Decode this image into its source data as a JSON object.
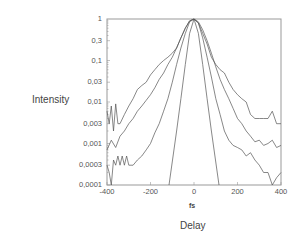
{
  "chart_data": {
    "type": "line",
    "title": "",
    "xlabel": "Delay",
    "x_unit": "fs",
    "ylabel": "Intensity",
    "yscale": "log",
    "xlim": [
      -400,
      400
    ],
    "ylim": [
      0.0001,
      1
    ],
    "grid": false,
    "legend": null,
    "x_ticks": [
      -400,
      -200,
      0,
      200,
      400
    ],
    "x_tick_labels": [
      "-400",
      "-200",
      "0",
      "200",
      "400"
    ],
    "y_ticks": [
      1,
      0.3,
      0.1,
      0.03,
      0.01,
      0.003,
      0.001,
      0.0003,
      0.0001
    ],
    "y_tick_labels": [
      "1",
      "0,3",
      "0,1",
      "0,03",
      "0,01",
      "0,003",
      "0,001",
      "0,0003",
      "0,0001"
    ],
    "series": [
      {
        "name": "trace-1 (broadest, noisy plateau)",
        "x": [
          -400,
          -390,
          -380,
          -370,
          -360,
          -350,
          -340,
          -320,
          -300,
          -280,
          -260,
          -240,
          -220,
          -200,
          -180,
          -160,
          -140,
          -120,
          -100,
          -80,
          -60,
          -40,
          -20,
          0,
          20,
          40,
          60,
          80,
          100,
          120,
          140,
          160,
          180,
          200,
          220,
          240,
          260,
          280,
          300,
          320,
          340,
          360,
          380,
          400
        ],
        "y": [
          0.006,
          0.003,
          0.008,
          0.002,
          0.009,
          0.003,
          0.003,
          0.005,
          0.008,
          0.012,
          0.02,
          0.025,
          0.03,
          0.045,
          0.06,
          0.08,
          0.1,
          0.12,
          0.15,
          0.2,
          0.35,
          0.6,
          0.9,
          1.0,
          0.8,
          0.45,
          0.25,
          0.12,
          0.08,
          0.06,
          0.05,
          0.03,
          0.02,
          0.015,
          0.012,
          0.01,
          0.005,
          0.004,
          0.004,
          0.004,
          0.004,
          0.006,
          0.003,
          0.003
        ]
      },
      {
        "name": "trace-2",
        "x": [
          -400,
          -380,
          -360,
          -340,
          -320,
          -300,
          -280,
          -260,
          -240,
          -220,
          -200,
          -180,
          -160,
          -140,
          -120,
          -100,
          -80,
          -60,
          -40,
          -20,
          0,
          20,
          40,
          60,
          80,
          100,
          120,
          140,
          160,
          180,
          200,
          220,
          240,
          260,
          280,
          300,
          320,
          340,
          360,
          380,
          400
        ],
        "y": [
          0.0007,
          0.0012,
          0.0008,
          0.0015,
          0.002,
          0.003,
          0.004,
          0.006,
          0.008,
          0.011,
          0.015,
          0.022,
          0.035,
          0.05,
          0.08,
          0.12,
          0.2,
          0.35,
          0.6,
          0.9,
          1.0,
          0.85,
          0.55,
          0.3,
          0.15,
          0.07,
          0.035,
          0.02,
          0.012,
          0.007,
          0.004,
          0.003,
          0.002,
          0.0015,
          0.0011,
          0.0012,
          0.0009,
          0.001,
          0.0012,
          0.0008,
          0.0009
        ]
      },
      {
        "name": "trace-3 (lowest, noisy)",
        "x": [
          -400,
          -390,
          -380,
          -370,
          -360,
          -350,
          -340,
          -330,
          -320,
          -310,
          -300,
          -280,
          -260,
          -240,
          -220,
          -200,
          -180,
          -160,
          -140,
          -120,
          -100,
          -80,
          -60,
          -40,
          -20,
          0,
          20,
          40,
          60,
          80,
          100,
          120,
          140,
          160,
          180,
          200,
          220,
          240,
          260,
          280,
          300,
          320,
          340,
          360,
          380,
          400
        ],
        "y": [
          0.0003,
          0.0002,
          0.0001,
          0.0004,
          0.0003,
          0.0005,
          0.0003,
          0.0005,
          0.0003,
          0.0005,
          0.0003,
          0.0003,
          0.0004,
          0.0005,
          0.0007,
          0.001,
          0.0018,
          0.003,
          0.006,
          0.012,
          0.03,
          0.08,
          0.2,
          0.45,
          0.85,
          1.0,
          0.8,
          0.35,
          0.12,
          0.04,
          0.012,
          0.005,
          0.002,
          0.0012,
          0.0009,
          0.0008,
          0.0007,
          0.0005,
          0.0006,
          0.0004,
          0.0003,
          0.0002,
          0.0002,
          0.0001,
          0.00015,
          0.0002
        ]
      },
      {
        "name": "trace-4 (narrow, Gaussian-like)",
        "x": [
          -115,
          -80,
          -60,
          -40,
          -20,
          0,
          20,
          40,
          60,
          80,
          115
        ],
        "y": [
          0.0001,
          0.002,
          0.012,
          0.08,
          0.45,
          1.0,
          0.45,
          0.08,
          0.012,
          0.002,
          0.0001
        ]
      }
    ]
  }
}
